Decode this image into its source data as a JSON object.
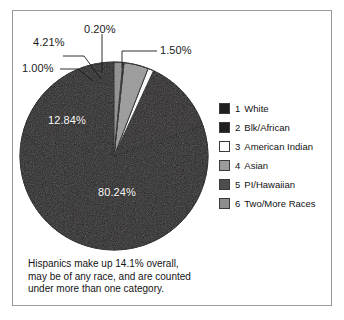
{
  "frame": {
    "border_color": "#9a9a9a",
    "background": "#ffffff"
  },
  "chart_data": {
    "type": "pie",
    "title": "",
    "categories": [
      "White",
      "Blk/African",
      "American Indian",
      "Asian",
      "PI/Hawaiian",
      "Two/More Races"
    ],
    "values": [
      80.24,
      12.84,
      1.0,
      4.21,
      0.2,
      1.5
    ],
    "value_labels": [
      "80.24%",
      "12.84%",
      "1.00%",
      "4.21%",
      "0.20%",
      "1.50%"
    ],
    "units": "percent",
    "legend_position": "right",
    "grid": false,
    "colors": [
      "#221f1f",
      "#231f20",
      "#ffffff",
      "#9b9b9b",
      "#4d4d4d",
      "#8e8e8e"
    ],
    "start_angle_deg": -90,
    "direction": "counterclockwise",
    "annotation": "Hispanics make up 14.1% overall, may be of any race, and are counted under more than one category."
  },
  "legend": {
    "items": [
      {
        "num": "1",
        "label": "White",
        "color": "#221f1f"
      },
      {
        "num": "2",
        "label": "Blk/African",
        "color": "#231f20"
      },
      {
        "num": "3",
        "label": "American Indian",
        "color": "#ffffff"
      },
      {
        "num": "4",
        "label": "Asian",
        "color": "#9b9b9b"
      },
      {
        "num": "5",
        "label": "PI/Hawaiian",
        "color": "#4d4d4d"
      },
      {
        "num": "6",
        "label": "Two/More Races",
        "color": "#8e8e8e"
      }
    ]
  },
  "pie_labels": {
    "white": "80.24%",
    "blk_african": "12.84%",
    "american_indian": "1.00%",
    "asian": "4.21%",
    "pi_hawaiian": "0.20%",
    "two_more_races": "1.50%"
  },
  "caption": {
    "line1": "Hispanics make up 14.1% overall,",
    "line2": "may be of any race, and are counted",
    "line3": "under more than one category."
  }
}
